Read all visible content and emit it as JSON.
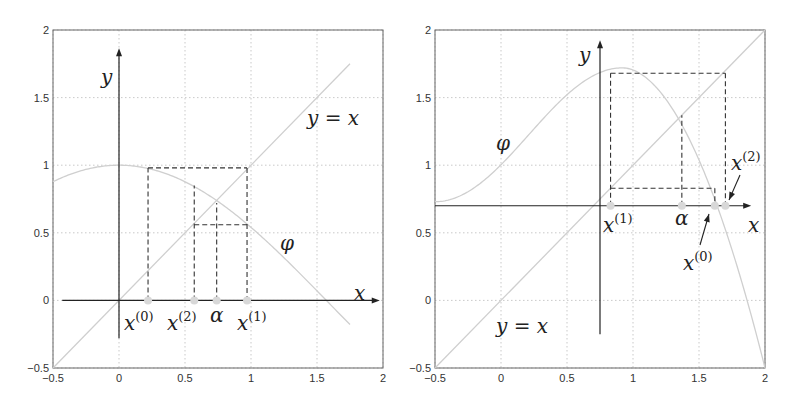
{
  "chart_data": [
    {
      "type": "line",
      "title": "Fixed-point iteration, convergent (oscillating) case",
      "xlim": [
        -0.5,
        2
      ],
      "ylim": [
        -0.5,
        2
      ],
      "xticks": [
        "-0.5",
        "0",
        "0.5",
        "1",
        "1.5",
        "2"
      ],
      "yticks": [
        "-0.5",
        "0",
        "0.5",
        "1",
        "1.5",
        "2"
      ],
      "grid": true,
      "axes_origin": [
        0,
        0
      ],
      "series": [
        {
          "name": "phi",
          "label": "φ",
          "function": "cos(x)",
          "x_range": [
            -0.5,
            1.75
          ]
        },
        {
          "name": "y=x",
          "label": "y = x",
          "x_range": [
            -0.5,
            1.75
          ]
        }
      ],
      "iterates": [
        {
          "label": "x(0)",
          "x": 0.22
        },
        {
          "label": "x(1)",
          "x": 0.97
        },
        {
          "label": "x(2)",
          "x": 0.57
        }
      ],
      "fixed_point": {
        "label": "α",
        "x": 0.74,
        "y": 0.74
      },
      "annotations": [
        "x",
        "y",
        "y = x",
        "φ",
        "x(0)",
        "x(2)",
        "α",
        "x(1)"
      ]
    },
    {
      "type": "line",
      "title": "Fixed-point iteration, divergent case",
      "xlim": [
        -0.5,
        2
      ],
      "ylim": [
        -0.5,
        2
      ],
      "xticks": [
        "-0.5",
        "0",
        "0.5",
        "1",
        "1.5",
        "2"
      ],
      "yticks": [
        "-0.5",
        "0",
        "0.5",
        "1",
        "1.5",
        "2"
      ],
      "grid": true,
      "axes_origin": [
        0.75,
        0.7
      ],
      "series": [
        {
          "name": "phi",
          "label": "φ",
          "peak": [
            0.92,
            1.72
          ],
          "x_range": [
            -0.5,
            2
          ]
        },
        {
          "name": "y=x",
          "label": "y = x",
          "x_range": [
            -0.5,
            2
          ]
        }
      ],
      "iterates": [
        {
          "label": "x(0)",
          "x": 1.62
        },
        {
          "label": "x(1)",
          "x": 0.83
        },
        {
          "label": "x(2)",
          "x": 1.7
        }
      ],
      "fixed_point": {
        "label": "α",
        "x": 1.37,
        "y": 1.37
      },
      "annotations": [
        "x",
        "y",
        "y = x",
        "φ",
        "x(1)",
        "α",
        "x(0)",
        "x(2)"
      ]
    }
  ],
  "labels": {
    "x": "x",
    "y": "y",
    "yx": "y = x",
    "phi": "φ",
    "alpha": "α",
    "xbase": "x",
    "s0": "(0)",
    "s1": "(1)",
    "s2": "(2)"
  }
}
